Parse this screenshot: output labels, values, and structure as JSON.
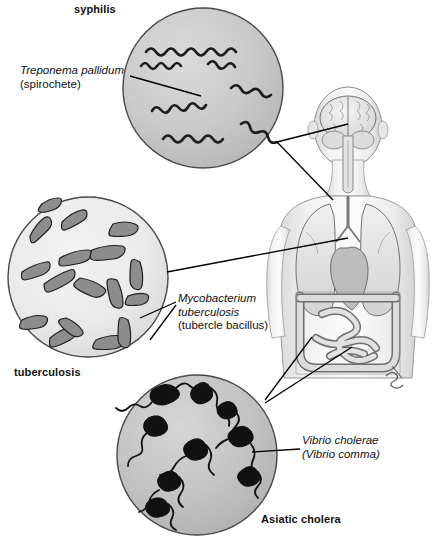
{
  "figure": {
    "background_color": "#ffffff",
    "ink_color": "#111111"
  },
  "disease_labels": [
    {
      "id": "syphilis",
      "text": "syphilis",
      "x": 74,
      "y": 3,
      "style": "bold"
    },
    {
      "id": "tuberculosis",
      "text": "tuberculosis",
      "x": 14,
      "y": 366,
      "style": "bold"
    },
    {
      "id": "asiatic-cholera",
      "text": "Asiatic cholera",
      "x": 261,
      "y": 513,
      "style": "bold"
    }
  ],
  "organism_labels": [
    {
      "id": "treponema",
      "x": 20,
      "y": 64,
      "lines": [
        {
          "text": "Treponema pallidum",
          "style": "italic"
        },
        {
          "text": "(spirochete)",
          "style": "roman"
        }
      ]
    },
    {
      "id": "mycobacterium",
      "x": 178,
      "y": 292,
      "lines": [
        {
          "text": "Mycobacterium",
          "style": "italic"
        },
        {
          "text": "tuberculosis",
          "style": "italic"
        },
        {
          "text": "(tubercle bacillus)",
          "style": "roman"
        }
      ]
    },
    {
      "id": "vibrio",
      "x": 302,
      "y": 434,
      "lines": [
        {
          "text": "Vibrio cholerae",
          "style": "italic"
        },
        {
          "text": "(Vibrio comma)",
          "style": "italic"
        }
      ]
    }
  ],
  "micrographs": [
    {
      "id": "syphilis-circle",
      "disease": "syphilis",
      "organism": "Treponema pallidum",
      "morphology": "spirochete",
      "cx": 203,
      "cy": 88,
      "r": 80,
      "fill": "#c9c9c9",
      "organism_count": 6
    },
    {
      "id": "tuberculosis-circle",
      "disease": "tuberculosis",
      "organism": "Mycobacterium tuberculosis",
      "morphology": "bacillus",
      "cx": 88,
      "cy": 277,
      "r": 80,
      "fill": "#ededed",
      "organism_count": 17
    },
    {
      "id": "cholera-circle",
      "disease": "Asiatic cholera",
      "organism": "Vibrio cholerae",
      "morphology": "comma-shaped vibrio with flagellum",
      "cx": 197,
      "cy": 455,
      "r": 80,
      "fill": "#c4c4c4",
      "organism_count": 11
    }
  ],
  "anatomy": {
    "id": "human-torso",
    "view": "posterior",
    "description": "Human head and torso showing brain, lungs and intestines",
    "organs": [
      {
        "id": "brain",
        "label": "brain",
        "target_x": 348,
        "target_y": 124
      },
      {
        "id": "lungs",
        "label": "lungs",
        "target_x": 348,
        "target_y": 238
      },
      {
        "id": "intestines",
        "label": "intestines",
        "target_x": 352,
        "target_y": 318
      }
    ],
    "signature": {
      "present": true,
      "x": 395,
      "y": 372
    }
  },
  "leader_lines": [
    {
      "id": "treponema-leader",
      "from": "treponema-label",
      "to": "syphilis-circle",
      "points": "130,76 201,96"
    },
    {
      "id": "mycobacterium-leader-a",
      "from": "mycobacterium-label",
      "to": "tuberculosis-circle",
      "points": "176,302 140,318"
    },
    {
      "id": "mycobacterium-leader-b",
      "from": "mycobacterium-label",
      "to": "tuberculosis-circle",
      "points": "176,304 150,338"
    },
    {
      "id": "vibrio-leader",
      "from": "vibrio-label",
      "to": "cholera-circle",
      "points": "300,449 252,452"
    },
    {
      "id": "syphilis-to-brain",
      "from": "syphilis-circle",
      "to": "brain",
      "points": "277,142 348,124"
    },
    {
      "id": "syphilis-to-lungs",
      "from": "syphilis-circle",
      "to": "lungs",
      "points": "277,142 332,196"
    },
    {
      "id": "tb-to-lungs",
      "from": "tuberculosis-circle",
      "to": "lungs",
      "points": "167,272 348,238"
    },
    {
      "id": "cholera-to-intestines-a",
      "from": "cholera-circle",
      "to": "intestines",
      "points": "265,400 312,337"
    },
    {
      "id": "cholera-to-intestines-b",
      "from": "cholera-circle",
      "to": "intestines",
      "points": "265,402 352,346"
    }
  ]
}
